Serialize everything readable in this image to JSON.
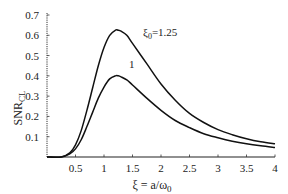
{
  "chart_data": {
    "type": "line",
    "title": "",
    "xlabel": "ξ = a/ω₀",
    "ylabel": "SNR_CL",
    "ylabel_main": "SNR",
    "ylabel_sub": "CL",
    "xlabel_main": "ξ = a/ω",
    "xlabel_sub": "0",
    "xlim": [
      0,
      4
    ],
    "ylim": [
      0,
      0.7
    ],
    "grid": false,
    "x_ticks": [
      0.5,
      1,
      1.5,
      2,
      2.5,
      3,
      3.5,
      4
    ],
    "x_tick_labels": [
      "0.5",
      "1",
      "1.5",
      "2",
      "2.5",
      "3",
      "3.5",
      "4"
    ],
    "y_ticks": [
      0.1,
      0.2,
      0.3,
      0.4,
      0.5,
      0.6,
      0.7
    ],
    "y_tick_labels": [
      "0.1",
      "0.2",
      "0.3",
      "0.4",
      "0.5",
      "0.6",
      "0.7"
    ],
    "series": [
      {
        "name": "ξ0=1.25",
        "label_main": "ξ",
        "label_sub": "0",
        "label_value": "=1.25",
        "x": [
          0,
          0.25,
          0.4,
          0.5,
          0.6,
          0.7,
          0.8,
          0.9,
          1.0,
          1.1,
          1.2,
          1.25,
          1.3,
          1.4,
          1.5,
          1.75,
          2.0,
          2.25,
          2.5,
          2.75,
          3.0,
          3.25,
          3.5,
          3.75,
          4.0
        ],
        "y": [
          0,
          0.0,
          0.02,
          0.06,
          0.13,
          0.23,
          0.34,
          0.45,
          0.54,
          0.6,
          0.625,
          0.625,
          0.62,
          0.6,
          0.56,
          0.46,
          0.36,
          0.28,
          0.215,
          0.17,
          0.135,
          0.11,
          0.09,
          0.075,
          0.065
        ]
      },
      {
        "name": "ξ0=1",
        "label_main": "1",
        "x": [
          0,
          0.25,
          0.4,
          0.5,
          0.6,
          0.7,
          0.8,
          0.9,
          1.0,
          1.1,
          1.2,
          1.25,
          1.3,
          1.4,
          1.5,
          1.75,
          2.0,
          2.25,
          2.5,
          2.75,
          3.0,
          3.25,
          3.5,
          3.75,
          4.0
        ],
        "y": [
          0,
          0.0,
          0.015,
          0.04,
          0.085,
          0.15,
          0.22,
          0.29,
          0.345,
          0.385,
          0.4,
          0.4,
          0.395,
          0.38,
          0.355,
          0.29,
          0.23,
          0.18,
          0.145,
          0.115,
          0.095,
          0.078,
          0.065,
          0.055,
          0.047
        ]
      }
    ],
    "legend": "none (inline curve labels)"
  }
}
